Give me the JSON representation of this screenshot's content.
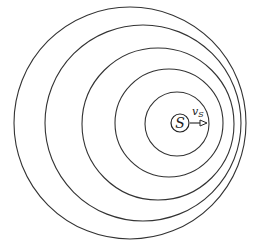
{
  "diagram": {
    "title": "",
    "source": {
      "label": "S",
      "cx": 180,
      "cy": 123,
      "r": 9
    },
    "velocity": {
      "label": "v",
      "subscript": "S",
      "x1": 190,
      "x2": 207,
      "y": 123
    },
    "wavefronts": [
      {
        "cx": 130,
        "cy": 123,
        "r": 116
      },
      {
        "cx": 143,
        "cy": 123,
        "r": 98
      },
      {
        "cx": 158,
        "cy": 124,
        "r": 76
      },
      {
        "cx": 169,
        "cy": 123,
        "r": 54
      },
      {
        "cx": 177,
        "cy": 124,
        "r": 32
      }
    ],
    "colors": {
      "stroke": "#333333",
      "background": "#ffffff"
    }
  }
}
